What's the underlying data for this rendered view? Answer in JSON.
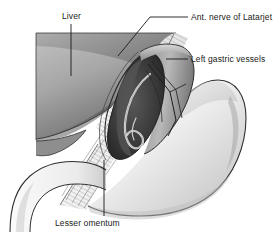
{
  "figure": {
    "kind": "anatomical-illustration",
    "background_color": "#ffffff",
    "line_color": "#1a1a1a",
    "text_color": "#1a1a1a"
  },
  "labels": {
    "liver": "Liver",
    "nerve": "Ant. nerve of Latarjet",
    "vessels": "Left gastric vessels",
    "omentum": "Lesser omentum"
  },
  "structures": {
    "liver": {
      "name": "liver",
      "fill_light": "#b8b8b8",
      "fill_dark": "#6f6f6f"
    },
    "omentum": {
      "name": "lesser-omentum",
      "fill": "#f2f2f2",
      "striation_color": "#8c8c8c"
    },
    "window": {
      "name": "dissection-window",
      "fill_dark": "#2e2e2e",
      "fill_mid": "#4a4a4a"
    },
    "stomach": {
      "name": "stomach",
      "fill_light": "#f6f6f6",
      "fill_shadow": "#c9c9c9"
    },
    "esophagus": {
      "name": "esophagus",
      "fill": "#f4f4f4"
    },
    "nerve": {
      "name": "anterior-nerve-of-latarjet",
      "stroke": "#dcdcdc"
    },
    "vessels": {
      "name": "left-gastric-vessels",
      "stroke": "#1a1a1a"
    }
  },
  "leader_lines": {
    "liver": "vertical from label down into liver body",
    "nerve": "diagonal from label left-down to nerve in window",
    "vessels": "horizontal from label left to vessel bundle",
    "omentum": "vertical from label up into striated omentum"
  }
}
